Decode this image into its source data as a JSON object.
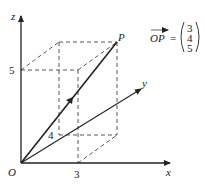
{
  "diagram": {
    "type": "3d-coordinate-vector",
    "axes": {
      "x_label": "x",
      "y_label": "y",
      "z_label": "z",
      "origin_label": "O"
    },
    "ticks": {
      "x": "3",
      "y": "4",
      "z": "5"
    },
    "point": {
      "label": "P",
      "coords": [
        3,
        4,
        5
      ]
    },
    "equation": {
      "lhs": "OP",
      "equals": "=",
      "vector": [
        "3",
        "4",
        "5"
      ]
    }
  }
}
